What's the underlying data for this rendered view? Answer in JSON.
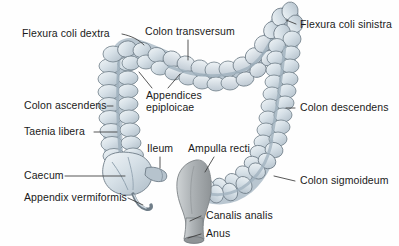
{
  "figure": {
    "background_color": "#fefefe",
    "organ_fill": "#c9d4dc",
    "organ_fill_light": "#e4ebf0",
    "organ_outline": "#6f7d88",
    "rectum_fill": "#a9aeb0",
    "leader_color": "#3a3a3a",
    "label_color": "#1a1a1a"
  },
  "labels": {
    "flexura_coli_dextra": "Flexura coli dextra",
    "colon_transversum": "Colon transversum",
    "flexura_coli_sinistra": "Flexura coli sinistra",
    "colon_ascendens": "Colon ascendens",
    "appendices_epiploicae_line1": "Appendices",
    "appendices_epiploicae_line2": "epiploicae",
    "colon_descendens": "Colon descendens",
    "taenia_libera": "Taenia libera",
    "ileum": "Ileum",
    "ampulla_recti": "Ampulla recti",
    "caecum": "Caecum",
    "colon_sigmoideum": "Colon sigmoideum",
    "appendix_vermiformis": "Appendix vermiformis",
    "canalis_analis": "Canalis analis",
    "anus": "Anus"
  },
  "structures": [
    {
      "name": "flexura-coli-dextra",
      "label": "Flexura coli dextra",
      "side": "left",
      "region": "hepatic flexure"
    },
    {
      "name": "colon-transversum",
      "label": "Colon transversum",
      "side": "top",
      "region": "transverse colon"
    },
    {
      "name": "flexura-coli-sinistra",
      "label": "Flexura coli sinistra",
      "side": "right",
      "region": "splenic flexure"
    },
    {
      "name": "colon-ascendens",
      "label": "Colon ascendens",
      "side": "left",
      "region": "ascending colon"
    },
    {
      "name": "appendices-epiploicae",
      "label": "Appendices epiploicae",
      "side": "center",
      "region": "fatty appendages"
    },
    {
      "name": "colon-descendens",
      "label": "Colon descendens",
      "side": "right",
      "region": "descending colon"
    },
    {
      "name": "taenia-libera",
      "label": "Taenia libera",
      "side": "left",
      "region": "longitudinal muscle band"
    },
    {
      "name": "ileum",
      "label": "Ileum",
      "side": "center",
      "region": "terminal ileum"
    },
    {
      "name": "ampulla-recti",
      "label": "Ampulla recti",
      "side": "center",
      "region": "rectal ampulla"
    },
    {
      "name": "caecum",
      "label": "Caecum",
      "side": "left",
      "region": "cecum"
    },
    {
      "name": "colon-sigmoideum",
      "label": "Colon sigmoideum",
      "side": "right",
      "region": "sigmoid colon"
    },
    {
      "name": "appendix-vermiformis",
      "label": "Appendix vermiformis",
      "side": "left",
      "region": "vermiform appendix"
    },
    {
      "name": "canalis-analis",
      "label": "Canalis analis",
      "side": "center",
      "region": "anal canal"
    },
    {
      "name": "anus",
      "label": "Anus",
      "side": "center",
      "region": "anus"
    }
  ]
}
